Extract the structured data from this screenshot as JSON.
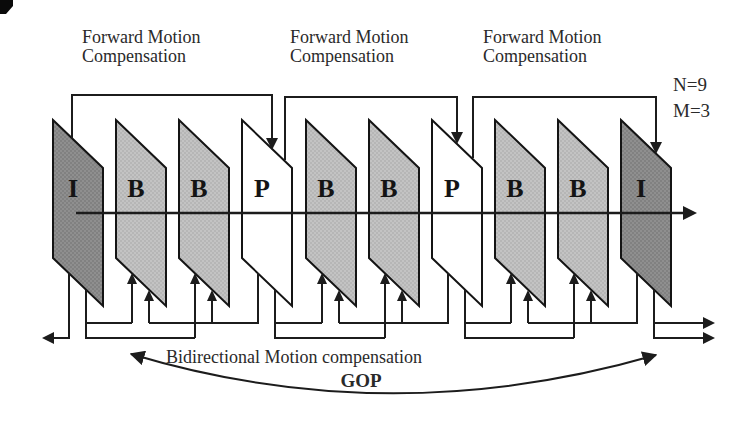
{
  "figure": {
    "forward_labels": [
      {
        "line1": "Forward Motion",
        "line2": "Compensation"
      },
      {
        "line1": "Forward Motion",
        "line2": "Compensation"
      },
      {
        "line1": "Forward Motion",
        "line2": "Compensation"
      }
    ],
    "params": {
      "n": "N=9",
      "m": "M=3"
    },
    "frames": [
      {
        "label": "I"
      },
      {
        "label": "B"
      },
      {
        "label": "B"
      },
      {
        "label": "P"
      },
      {
        "label": "B"
      },
      {
        "label": "B"
      },
      {
        "label": "P"
      },
      {
        "label": "B"
      },
      {
        "label": "B"
      },
      {
        "label": "I"
      }
    ],
    "captions": {
      "bidirectional": "Bidirectional Motion compensation",
      "gop": "GOP"
    },
    "colors": {
      "i_frame": "#8f8f8f",
      "b_frame": "#c3c3c3",
      "p_frame": "#ffffff",
      "i_dot": "#707070",
      "b_dot": "#a6a6a6",
      "outline": "#141414",
      "line": "#1c1c1c",
      "text": "#2a2a2a"
    }
  }
}
